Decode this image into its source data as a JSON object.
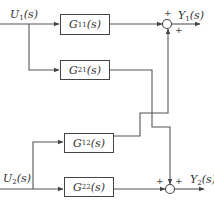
{
  "diagram": {
    "title": "",
    "inputs": [
      {
        "id": "U1",
        "label_main": "U",
        "label_sub": "1",
        "label_tail": "(s)"
      },
      {
        "id": "U2",
        "label_main": "U",
        "label_sub": "2",
        "label_tail": "(s)"
      }
    ],
    "outputs": [
      {
        "id": "Y1",
        "label_main": "Y",
        "label_sub": "1",
        "label_tail": "(s)"
      },
      {
        "id": "Y2",
        "label_main": "Y",
        "label_sub": "2",
        "label_tail": "(s)"
      }
    ],
    "blocks": [
      {
        "id": "G11",
        "label_main": "G",
        "label_sub": "11",
        "label_tail": "(s)"
      },
      {
        "id": "G21",
        "label_main": "G",
        "label_sub": "21",
        "label_tail": "(s)"
      },
      {
        "id": "G12",
        "label_main": "G",
        "label_sub": "12",
        "label_tail": "(s)"
      },
      {
        "id": "G22",
        "label_main": "G",
        "label_sub": "22",
        "label_tail": "(s)"
      }
    ],
    "summing_junctions": [
      {
        "id": "S1",
        "signs": [
          "+",
          "+"
        ]
      },
      {
        "id": "S2",
        "signs": [
          "+",
          "+"
        ]
      }
    ],
    "edges": [
      {
        "from": "U1",
        "to": "G11"
      },
      {
        "from": "U1",
        "to": "G21"
      },
      {
        "from": "U2",
        "to": "G12"
      },
      {
        "from": "U2",
        "to": "G22"
      },
      {
        "from": "G11",
        "to": "S1"
      },
      {
        "from": "G12",
        "to": "S1"
      },
      {
        "from": "G21",
        "to": "S2"
      },
      {
        "from": "G22",
        "to": "S2"
      },
      {
        "from": "S1",
        "to": "Y1"
      },
      {
        "from": "S2",
        "to": "Y2"
      }
    ]
  }
}
